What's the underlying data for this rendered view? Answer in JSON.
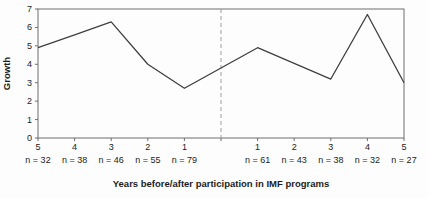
{
  "chart_data": {
    "type": "line",
    "title": "",
    "xlabel": "Years before/after participation in IMF programs",
    "ylabel": "Growth",
    "ylim": [
      0,
      7
    ],
    "y_ticks": [
      "0",
      "1",
      "2",
      "3",
      "4",
      "5",
      "6",
      "7"
    ],
    "x_tick_labels": [
      "5",
      "4",
      "3",
      "2",
      "1",
      "1",
      "2",
      "3",
      "4",
      "5"
    ],
    "n_labels": [
      "n = 32",
      "n = 38",
      "n = 46",
      "n = 55",
      "n = 79",
      "n = 61",
      "n = 43",
      "n = 38",
      "n = 32",
      "n = 27"
    ],
    "series": [
      {
        "name": "growth",
        "x_years": [
          -5,
          -4,
          -3,
          -2,
          -1,
          1,
          2,
          3,
          4,
          5
        ],
        "values": [
          4.9,
          5.6,
          6.3,
          4.0,
          2.7,
          4.9,
          4.05,
          3.2,
          6.7,
          3.0
        ]
      }
    ],
    "divider_year": 0,
    "grid": false,
    "legend": "none",
    "colors": {
      "line": "#3f3f3f",
      "frame": "#6f6f6f",
      "divider": "#a6a6a6",
      "text": "#1c1c1c"
    }
  }
}
